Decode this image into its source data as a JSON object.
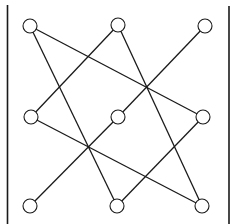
{
  "diagram": {
    "type": "graph",
    "background": "#ffffff",
    "stroke_color": "#1a1a1a",
    "node_radius": 7,
    "bars": [
      {
        "id": "left-bar",
        "x": 7.5,
        "y1": 5,
        "y2": 224
      },
      {
        "id": "right-bar",
        "x": 229,
        "y1": 6,
        "y2": 224
      }
    ],
    "nodes": [
      {
        "id": "top-left",
        "x": 30,
        "y": 26
      },
      {
        "id": "top-middle",
        "x": 118,
        "y": 25
      },
      {
        "id": "top-right",
        "x": 205,
        "y": 26
      },
      {
        "id": "middle-left",
        "x": 31,
        "y": 117
      },
      {
        "id": "center",
        "x": 118,
        "y": 117
      },
      {
        "id": "middle-right",
        "x": 203,
        "y": 117
      },
      {
        "id": "bottom-left",
        "x": 30,
        "y": 206
      },
      {
        "id": "bottom-middle",
        "x": 117,
        "y": 206
      },
      {
        "id": "bottom-right",
        "x": 202,
        "y": 206
      }
    ],
    "edges": [
      {
        "from": "top-left",
        "to": "middle-right"
      },
      {
        "from": "top-left",
        "to": "bottom-middle"
      },
      {
        "from": "top-middle",
        "to": "middle-left"
      },
      {
        "from": "top-middle",
        "to": "bottom-right"
      },
      {
        "from": "top-right",
        "to": "center"
      },
      {
        "from": "center",
        "to": "bottom-left"
      },
      {
        "from": "middle-left",
        "to": "bottom-right"
      },
      {
        "from": "middle-right",
        "to": "bottom-middle"
      }
    ]
  }
}
